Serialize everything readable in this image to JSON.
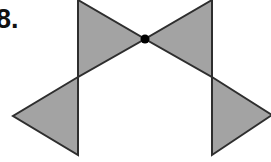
{
  "problem": {
    "number_label": "8."
  },
  "figure": {
    "fill_color": "#a3a3a3",
    "stroke_color": "#2e2e2e",
    "dot_color": "#000000",
    "triangles": [
      {
        "name": "top-left-triangle",
        "points": "78,0 145,39 78,77"
      },
      {
        "name": "top-right-triangle",
        "points": "212,0 145,39 212,77"
      },
      {
        "name": "bottom-left-triangle",
        "points": "78,77 13,116 78,155"
      },
      {
        "name": "bottom-right-triangle",
        "points": "212,77 272,115 212,155"
      }
    ],
    "center_point": {
      "cx": 145,
      "cy": 39,
      "r": 4.5
    }
  }
}
